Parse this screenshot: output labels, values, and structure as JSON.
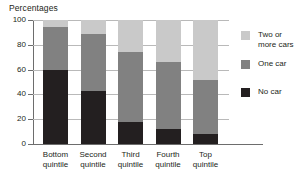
{
  "chart_data": {
    "type": "bar",
    "subtype": "stacked-vertical-100",
    "title": "Percentages",
    "xlabel": "",
    "ylabel": "",
    "ylim": [
      0,
      100
    ],
    "yticks": [
      0,
      20,
      40,
      60,
      80,
      100
    ],
    "ytick_labels": [
      "0",
      "20",
      "40",
      "60",
      "80",
      "100"
    ],
    "grid": true,
    "grid_axis": "y",
    "legend_position": "right",
    "categories": [
      "Bottom quintile",
      "Second quintile",
      "Third quintile",
      "Fourth quintile",
      "Top quintile"
    ],
    "category_lines": [
      [
        "Bottom",
        "quintile"
      ],
      [
        "Second",
        "quintile"
      ],
      [
        "Third",
        "quintile"
      ],
      [
        "Fourth",
        "quintile"
      ],
      [
        "Top",
        "quintile"
      ]
    ],
    "series": [
      {
        "name": "No car",
        "color": "#231f20",
        "values": [
          60,
          43,
          18,
          12,
          8
        ]
      },
      {
        "name": "One car",
        "color": "#818181",
        "values": [
          34,
          46,
          56,
          54,
          44
        ]
      },
      {
        "name": "Two or more cars",
        "color": "#c9c9c9",
        "values": [
          6,
          11,
          26,
          34,
          48
        ]
      }
    ],
    "legend_entries": [
      {
        "label": "Two or more cars",
        "lines": [
          "Two or",
          "more cars"
        ],
        "color": "#c9c9c9"
      },
      {
        "label": "One car",
        "lines": [
          "One car"
        ],
        "color": "#818181"
      },
      {
        "label": "No car",
        "lines": [
          "No car"
        ],
        "color": "#231f20"
      }
    ]
  },
  "colors": {
    "two_or_more_cars": "#c9c9c9",
    "one_car": "#818181",
    "no_car": "#231f20",
    "axis": "#6d6d6d",
    "gridline": "#b9b9b9",
    "text": "#231f20",
    "background": "#ffffff"
  }
}
